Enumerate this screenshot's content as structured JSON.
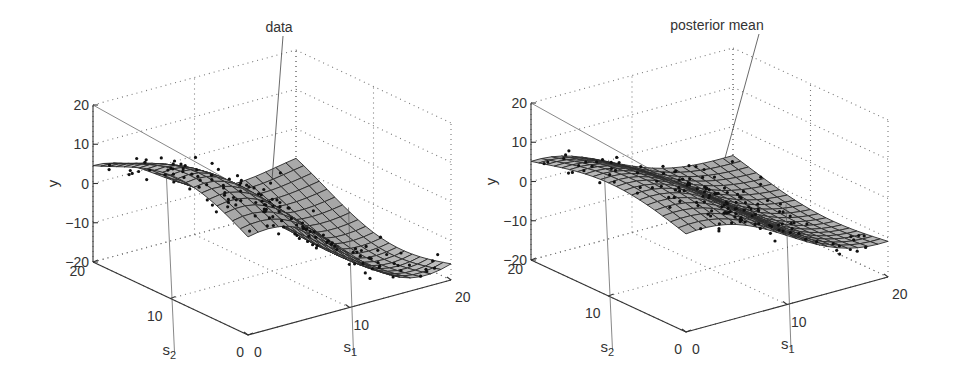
{
  "chart_data": [
    {
      "type": "surface3d",
      "panel": "left",
      "annotation": "data",
      "xlabel": "s1",
      "ylabel": "s2",
      "zlabel": "y",
      "x_ticks": [
        0,
        10,
        20
      ],
      "y_ticks": [
        0,
        10,
        20
      ],
      "z_ticks": [
        20,
        10,
        0,
        -10,
        -20
      ],
      "xlim": [
        0,
        20
      ],
      "ylim": [
        0,
        20
      ],
      "zlim": [
        -20,
        20
      ],
      "grid": "dotted",
      "surface_description": "Smooth wavy surface, high (~10) near s1=0..5 at large s2, descending to ~-15 near s1=15, s2 small; scattered noisy data points around the surface",
      "origin_px": [
        248,
        335
      ],
      "s1_vec_px": [
        203,
        -55
      ],
      "s2_vec_px": [
        -155,
        -73
      ],
      "z_vec_px": [
        0,
        -157
      ],
      "annot_anchor": [
        283,
        36
      ],
      "annot_target": [
        272,
        180
      ]
    },
    {
      "type": "surface3d",
      "panel": "right",
      "annotation": "posterior mean",
      "xlabel": "s1",
      "ylabel": "s2",
      "zlabel": "y",
      "x_ticks": [
        0,
        10,
        20
      ],
      "y_ticks": [
        0,
        10,
        20
      ],
      "z_ticks": [
        20,
        10,
        0,
        -10,
        -20
      ],
      "xlim": [
        0,
        20
      ],
      "ylim": [
        0,
        20
      ],
      "zlim": [
        -20,
        20
      ],
      "grid": "dotted",
      "surface_description": "Smoothed posterior mean surface: similar shape to data but flatter, high (~8) at s1 small / s2 large, declining to ~-10 toward s1=20",
      "origin_px": [
        686,
        332
      ],
      "s1_vec_px": [
        202,
        -55
      ],
      "s2_vec_px": [
        -155,
        -72
      ],
      "z_vec_px": [
        0,
        -157
      ],
      "annot_anchor": [
        759,
        34
      ],
      "annot_target": [
        725,
        158
      ]
    }
  ],
  "panels": {
    "left": {
      "annotation": "data",
      "z_axis_label": "y",
      "s1_label": "s",
      "s1_sub": "1",
      "s2_label": "s",
      "s2_sub": "2",
      "z_ticks": [
        "20",
        "10",
        "0",
        "−10",
        "−20"
      ],
      "s1_ticks": [
        "0",
        "10",
        "20"
      ],
      "s2_ticks": [
        "0",
        "10",
        "20"
      ]
    },
    "right": {
      "annotation": "posterior mean",
      "z_axis_label": "y",
      "s1_label": "s",
      "s1_sub": "1",
      "s2_label": "s",
      "s2_sub": "2",
      "z_ticks": [
        "20",
        "10",
        "0",
        "−10",
        "−20"
      ],
      "s1_ticks": [
        "0",
        "10",
        "20"
      ],
      "s2_ticks": [
        "0",
        "10",
        "20"
      ]
    }
  },
  "colors": {
    "axis": "#333333",
    "grid": "#777777",
    "mesh": "#2a2a2a",
    "surface_light": "#e8e8e8",
    "surface_dark": "#555555",
    "points": "#111111"
  }
}
